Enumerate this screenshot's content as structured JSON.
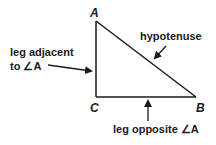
{
  "diagram": {
    "vertices": {
      "A": "A",
      "B": "B",
      "C": "C"
    },
    "labels": {
      "hypotenuse": "hypotenuse",
      "adjacent_line1": "leg adjacent",
      "adjacent_line2": "to ∠A",
      "opposite": "leg opposite ∠A"
    },
    "colors": {
      "stroke": "#1a1a1a",
      "background": "#ffffff"
    }
  }
}
